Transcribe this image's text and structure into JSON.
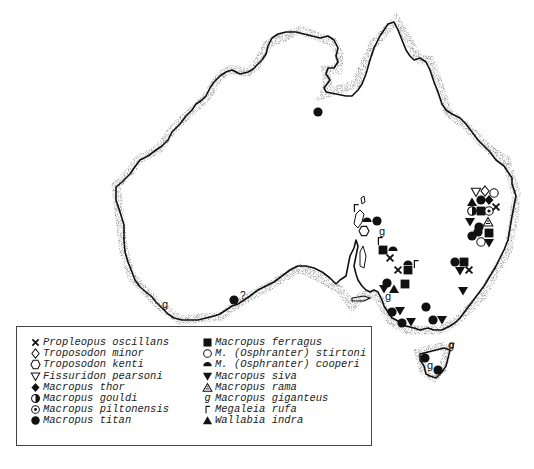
{
  "figure": {
    "type": "distribution-map",
    "region": "Australia"
  },
  "legend": {
    "left_column": [
      {
        "symbol": "x-cross",
        "label": "Propleopus oscillans"
      },
      {
        "symbol": "diamond-open",
        "label": "Troposodon minor"
      },
      {
        "symbol": "hexagon-open",
        "label": "Troposodon kenti"
      },
      {
        "symbol": "triangle-down-open",
        "label": "Fissuridon pearsoni"
      },
      {
        "symbol": "diamond-filled",
        "label": "Macropus thor"
      },
      {
        "symbol": "circle-half",
        "label": "Macropus gouldi"
      },
      {
        "symbol": "circle-dot",
        "label": "Macropus piltonensis"
      },
      {
        "symbol": "circle-filled",
        "label": "Macropus titan"
      }
    ],
    "right_column": [
      {
        "symbol": "square-filled",
        "label": "Macropus ferragus"
      },
      {
        "symbol": "circle-open",
        "label": "M. (Osphranter) stirtoni"
      },
      {
        "symbol": "semicircle-filled",
        "label": "M. (Osphranter) cooperi"
      },
      {
        "symbol": "triangle-down-filled",
        "label": "Macropus siva"
      },
      {
        "symbol": "triangle-hatched",
        "label": "Macropus rama"
      },
      {
        "symbol": "g-glyph",
        "label": "Macropus giganteus"
      },
      {
        "symbol": "corner-glyph",
        "label": "Megaleia rufa"
      },
      {
        "symbol": "triangle-up-filled",
        "label": "Wallabia indra"
      }
    ]
  },
  "annotations": [
    {
      "text": "?",
      "near": "south-west circle-filled locality"
    }
  ],
  "localities": [
    {
      "symbol": "circle-filled",
      "x": 318,
      "y": 112,
      "area": "north-central (Gulf)"
    },
    {
      "symbol": "circle-filled",
      "x": 234,
      "y": 300,
      "area": "south coast, uncertain",
      "note": "?"
    },
    {
      "symbol": "g-glyph",
      "x": 165,
      "y": 305,
      "area": "south-west"
    },
    {
      "symbol": "triangle-down-open",
      "x": 476,
      "y": 192,
      "area": "eastern cluster"
    },
    {
      "symbol": "diamond-open",
      "x": 485,
      "y": 191,
      "area": "eastern cluster"
    },
    {
      "symbol": "circle-open",
      "x": 494,
      "y": 193,
      "area": "eastern cluster"
    },
    {
      "symbol": "triangle-up-filled",
      "x": 472,
      "y": 202,
      "area": "eastern cluster"
    },
    {
      "symbol": "circle-filled",
      "x": 481,
      "y": 200,
      "area": "eastern cluster"
    },
    {
      "symbol": "diamond-filled",
      "x": 489,
      "y": 200,
      "area": "eastern cluster"
    },
    {
      "symbol": "circle-half",
      "x": 472,
      "y": 211,
      "area": "eastern cluster"
    },
    {
      "symbol": "square-filled",
      "x": 481,
      "y": 211,
      "area": "eastern cluster"
    },
    {
      "symbol": "circle-dot",
      "x": 489,
      "y": 211,
      "area": "eastern cluster"
    },
    {
      "symbol": "x-cross",
      "x": 496,
      "y": 207,
      "area": "eastern cluster"
    },
    {
      "symbol": "triangle-down-filled",
      "x": 470,
      "y": 222,
      "area": "eastern cluster"
    },
    {
      "symbol": "circle-filled",
      "x": 479,
      "y": 227,
      "area": "eastern cluster"
    },
    {
      "symbol": "triangle-hatched",
      "x": 488,
      "y": 222,
      "area": "eastern cluster"
    },
    {
      "symbol": "circle-filled",
      "x": 472,
      "y": 236,
      "area": "eastern cluster"
    },
    {
      "symbol": "square-filled",
      "x": 489,
      "y": 233,
      "area": "eastern cluster"
    },
    {
      "symbol": "circle-filled",
      "x": 478,
      "y": 232,
      "area": "eastern cluster"
    },
    {
      "symbol": "circle-open",
      "x": 481,
      "y": 242,
      "area": "eastern cluster"
    },
    {
      "symbol": "triangle-down-filled",
      "x": 489,
      "y": 243,
      "area": "eastern cluster"
    },
    {
      "symbol": "circle-filled",
      "x": 455,
      "y": 262,
      "area": "NSW"
    },
    {
      "symbol": "square-filled",
      "x": 464,
      "y": 262,
      "area": "NSW"
    },
    {
      "symbol": "triangle-down-filled",
      "x": 460,
      "y": 271,
      "area": "NSW"
    },
    {
      "symbol": "x-cross",
      "x": 469,
      "y": 270,
      "area": "NSW"
    },
    {
      "symbol": "triangle-down-filled",
      "x": 463,
      "y": 291,
      "area": "NSW"
    },
    {
      "symbol": "corner-glyph",
      "x": 356,
      "y": 208,
      "area": "SA lake region"
    },
    {
      "symbol": "semicircle-filled",
      "x": 367,
      "y": 220,
      "area": "SA lake region"
    },
    {
      "symbol": "circle-filled",
      "x": 377,
      "y": 221,
      "area": "SA lake region"
    },
    {
      "symbol": "hexagon-open",
      "x": 364,
      "y": 231,
      "area": "SA lake region"
    },
    {
      "symbol": "g-glyph",
      "x": 382,
      "y": 232,
      "area": "SA lake region"
    },
    {
      "symbol": "corner-glyph",
      "x": 380,
      "y": 241,
      "area": "SA lake region"
    },
    {
      "symbol": "square-filled",
      "x": 383,
      "y": 250,
      "area": "SA"
    },
    {
      "symbol": "semicircle-filled",
      "x": 393,
      "y": 249,
      "area": "SA"
    },
    {
      "symbol": "x-cross",
      "x": 390,
      "y": 258,
      "area": "SA"
    },
    {
      "symbol": "x-cross",
      "x": 398,
      "y": 270,
      "area": "SA"
    },
    {
      "symbol": "semicircle-filled",
      "x": 408,
      "y": 263,
      "area": "SA"
    },
    {
      "symbol": "square-filled",
      "x": 408,
      "y": 270,
      "area": "SA"
    },
    {
      "symbol": "corner-glyph",
      "x": 416,
      "y": 264,
      "area": "SA"
    },
    {
      "symbol": "circle-filled",
      "x": 387,
      "y": 283,
      "area": "SA south-east"
    },
    {
      "symbol": "triangle-down-filled",
      "x": 384,
      "y": 289,
      "area": "SA south-east"
    },
    {
      "symbol": "triangle-up-filled",
      "x": 394,
      "y": 289,
      "area": "SA south-east"
    },
    {
      "symbol": "square-filled",
      "x": 405,
      "y": 284,
      "area": "SA south-east"
    },
    {
      "symbol": "g-glyph",
      "x": 388,
      "y": 297,
      "area": "SA south-east"
    },
    {
      "symbol": "circle-filled",
      "x": 392,
      "y": 312,
      "area": "Victoria west"
    },
    {
      "symbol": "triangle-down-filled",
      "x": 400,
      "y": 311,
      "area": "Victoria west"
    },
    {
      "symbol": "circle-filled",
      "x": 402,
      "y": 323,
      "area": "Victoria west"
    },
    {
      "symbol": "triangle-down-filled",
      "x": 411,
      "y": 322,
      "area": "Victoria west"
    },
    {
      "symbol": "circle-filled",
      "x": 426,
      "y": 307,
      "area": "Victoria"
    },
    {
      "symbol": "circle-filled",
      "x": 433,
      "y": 320,
      "area": "Victoria"
    },
    {
      "symbol": "triangle-down-filled",
      "x": 442,
      "y": 320,
      "area": "Victoria"
    },
    {
      "symbol": "circle-filled",
      "x": 425,
      "y": 358,
      "area": "Tasmania north-west"
    },
    {
      "symbol": "g-glyph",
      "x": 430,
      "y": 366,
      "area": "Tasmania"
    },
    {
      "symbol": "circle-filled",
      "x": 438,
      "y": 370,
      "area": "Tasmania"
    },
    {
      "symbol": "g-glyph",
      "x": 451,
      "y": 346,
      "area": "Bass Strait island"
    }
  ]
}
